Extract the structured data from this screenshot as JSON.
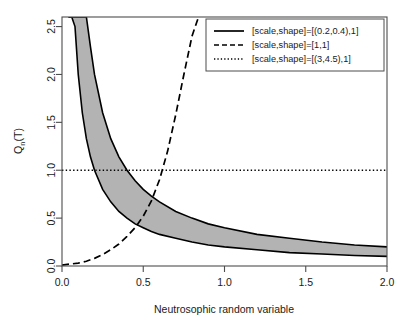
{
  "chart_data": {
    "type": "line",
    "title": "",
    "xlabel": "Neutrosophic random variable",
    "ylabel": "Qₙ(T)",
    "ylabel_base": "Q",
    "ylabel_sub": "n",
    "ylabel_tail": "(T)",
    "xlim": [
      0.0,
      2.0
    ],
    "ylim": [
      0.0,
      2.6
    ],
    "xticks": [
      "0.0",
      "0.5",
      "1.0",
      "1.5",
      "2.0"
    ],
    "xtick_values": [
      0.0,
      0.5,
      1.0,
      1.5,
      2.0
    ],
    "yticks": [
      "0.0",
      "0.5",
      "1.0",
      "1.5",
      "2.0",
      "2.5"
    ],
    "ytick_values": [
      0.0,
      0.5,
      1.0,
      1.5,
      2.0,
      2.5
    ],
    "grid": false,
    "legend_position": "top-right",
    "band_fill": "#b3b3b3",
    "line_color": "#000000",
    "series": [
      {
        "name": "[scale,shape]=[(0.2,0.4),1]",
        "style": "solid",
        "kind": "band",
        "note": "Shaded interval band between scale=0.2 and scale=0.4 curves, Q=scale/x",
        "x": [
          0.04,
          0.06,
          0.08,
          0.1,
          0.125,
          0.15,
          0.175,
          0.2,
          0.25,
          0.3,
          0.35,
          0.4,
          0.45,
          0.5,
          0.55,
          0.6,
          0.7,
          0.8,
          0.9,
          1.0,
          1.2,
          1.4,
          1.6,
          1.8,
          2.0
        ],
        "upper": [
          2.6,
          2.6,
          2.6,
          2.6,
          2.6,
          2.6,
          2.29,
          2.0,
          1.6,
          1.33,
          1.14,
          1.0,
          0.89,
          0.8,
          0.73,
          0.67,
          0.57,
          0.5,
          0.44,
          0.4,
          0.33,
          0.29,
          0.25,
          0.22,
          0.2
        ],
        "lower": [
          2.6,
          2.6,
          2.5,
          2.0,
          1.6,
          1.33,
          1.14,
          1.0,
          0.8,
          0.67,
          0.57,
          0.5,
          0.44,
          0.4,
          0.36,
          0.33,
          0.29,
          0.25,
          0.22,
          0.2,
          0.17,
          0.14,
          0.125,
          0.11,
          0.1
        ]
      },
      {
        "name": "[scale,shape]=[1,1]",
        "style": "dashed",
        "kind": "line",
        "note": "Increasing dashed curve exiting top of panel near x=0.84",
        "x": [
          0.0,
          0.05,
          0.1,
          0.15,
          0.2,
          0.25,
          0.3,
          0.35,
          0.4,
          0.45,
          0.5,
          0.55,
          0.6,
          0.65,
          0.7,
          0.75,
          0.8,
          0.84
        ],
        "y": [
          0.01,
          0.02,
          0.03,
          0.05,
          0.08,
          0.12,
          0.17,
          0.23,
          0.31,
          0.4,
          0.52,
          0.68,
          0.9,
          1.2,
          1.58,
          2.0,
          2.4,
          2.6
        ]
      },
      {
        "name": "[scale,shape]=[(3,4.5),1]",
        "style": "dotted",
        "kind": "line",
        "note": "Horizontal dotted line at Q=1.0 across full x range",
        "x": [
          0.0,
          2.0
        ],
        "y": [
          1.0,
          1.0
        ]
      }
    ],
    "legend": [
      {
        "label": "[scale,shape]=[(0.2,0.4),1]",
        "style": "solid"
      },
      {
        "label": "[scale,shape]=[1,1]",
        "style": "dashed"
      },
      {
        "label": "[scale,shape]=[(3,4.5),1]",
        "style": "dotted"
      }
    ]
  }
}
